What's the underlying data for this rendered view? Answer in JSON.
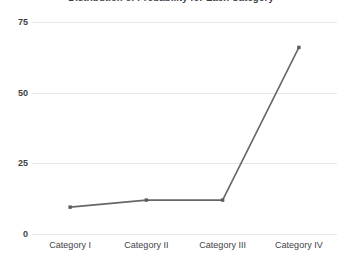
{
  "chart_data": {
    "type": "line",
    "title": "Distribution of Probability for Each Category",
    "xlabel": "",
    "ylabel": "",
    "categories": [
      "Category I",
      "Category II",
      "Category III",
      "Category IV"
    ],
    "values": [
      9.5,
      12,
      12,
      66
    ],
    "series": [
      {
        "name": "Probability",
        "values": [
          9.5,
          12,
          12,
          66
        ]
      }
    ],
    "ylim": [
      0,
      75
    ],
    "y_ticks": [
      0,
      25,
      50,
      75
    ],
    "y_tick_labels": [
      "0",
      "25",
      "50",
      "75"
    ],
    "grid": true,
    "grid_axis": "y",
    "legend": false,
    "legend_position": "none",
    "markers": true,
    "marker_shape": "square",
    "line_color": "#666666",
    "marker_color": "#5a5a5f",
    "grid_color": "#e8e8ea",
    "title_color": "#3f3f46",
    "tick_label_color": "#3f3f46",
    "background_color": "#ffffff",
    "title_clipped": true
  }
}
